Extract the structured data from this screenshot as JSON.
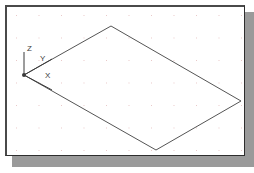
{
  "app": {
    "title": "CAD Drawing Area",
    "canvas_name": "isometric-drawing-canvas"
  },
  "panel": {
    "background_color": "#ffffff",
    "border_color": "#4a4a4a",
    "shadow_color": "#9a9a9a",
    "x": 5,
    "y": 5,
    "width": 240,
    "height": 151
  },
  "grid": {
    "visible": true,
    "dot_color": "#e9c8c8",
    "spacing_px": 22.5,
    "style": "dot"
  },
  "ucs_icon": {
    "name": "ucs-axis-indicator",
    "origin": {
      "x": 20,
      "y": 72
    },
    "origin_marker": "filled-dot",
    "stroke_color": "#3b3b3b",
    "axes": [
      {
        "label": "Z",
        "from": {
          "x": 20,
          "y": 72
        },
        "to": {
          "x": 20,
          "y": 49
        },
        "label_pos": {
          "x": 20,
          "y": 38
        }
      },
      {
        "label": "Y",
        "from": {
          "x": 20,
          "y": 72
        },
        "to": {
          "x": 48,
          "y": 56
        },
        "label_pos": {
          "x": 33,
          "y": 48
        }
      },
      {
        "label": "X",
        "from": {
          "x": 20,
          "y": 72
        },
        "to": {
          "x": 48,
          "y": 87
        },
        "label_pos": {
          "x": 38,
          "y": 65
        }
      }
    ]
  },
  "shape": {
    "name": "isometric-rectangle",
    "type": "parallelogram",
    "stroke_color": "#555555",
    "stroke_width": 1,
    "fill": "none",
    "vertices": [
      {
        "label": "origin-left",
        "x": 20,
        "y": 72
      },
      {
        "label": "top",
        "x": 107,
        "y": 23
      },
      {
        "label": "right",
        "x": 237,
        "y": 98
      },
      {
        "label": "bottom",
        "x": 152,
        "y": 147
      }
    ]
  }
}
